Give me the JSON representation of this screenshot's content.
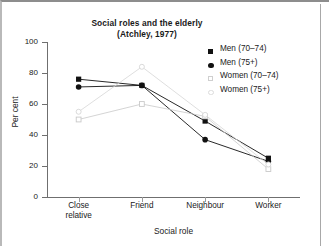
{
  "chart_data": {
    "type": "line",
    "title": "Social roles and the elderly",
    "subtitle": "(Atchley, 1977)",
    "xlabel": "Social role",
    "ylabel": "Per cent",
    "categories": [
      "Close relative",
      "Friend",
      "Neighbour",
      "Worker"
    ],
    "ylim": [
      0,
      100
    ],
    "yticks": [
      0,
      20,
      40,
      60,
      80,
      100
    ],
    "grid": false,
    "legend_position": "top-right",
    "series": [
      {
        "name": "Men (70–74)",
        "marker": "filled-square",
        "color": "#111111",
        "values": [
          76,
          72,
          49,
          25
        ]
      },
      {
        "name": "Men (75+)",
        "marker": "filled-circle",
        "color": "#111111",
        "values": [
          71,
          72,
          37,
          23
        ]
      },
      {
        "name": "Women (70–74)",
        "marker": "open-square",
        "color": "#c9c9c9",
        "values": [
          50,
          60,
          52,
          18
        ]
      },
      {
        "name": "Women (75+)",
        "marker": "open-circle",
        "color": "#d6d6d6",
        "values": [
          55,
          84,
          53,
          21
        ]
      }
    ]
  },
  "chart": {
    "title_line1": "Social roles and the elderly",
    "title_line2": "(Atchley, 1977)",
    "y_axis_title": "Per cent",
    "x_axis_title": "Social role",
    "y_tick_labels": [
      "0",
      "20",
      "40",
      "60",
      "80",
      "100"
    ],
    "x_tick_labels": [
      "Close\nrelative",
      "Friend",
      "Neighbour",
      "Worker"
    ],
    "x_tick_label_0_line1": "Close",
    "x_tick_label_0_line2": "relative",
    "x_tick_label_1": "Friend",
    "x_tick_label_2": "Neighbour",
    "x_tick_label_3": "Worker"
  },
  "legend": {
    "items": [
      {
        "label": "Men (70–74)",
        "marker": "filled-square"
      },
      {
        "label": "Men (75+)",
        "marker": "filled-circle"
      },
      {
        "label": "Women (70–74)",
        "marker": "open-square"
      },
      {
        "label": "Women (75+)",
        "marker": "open-circle"
      }
    ]
  },
  "colors": {
    "ink": "#1a1a1a",
    "axis": "#6f6f6f",
    "dark_series": "#111111",
    "light_series": "#c9c9c9",
    "frame": "#a8a8a8"
  }
}
